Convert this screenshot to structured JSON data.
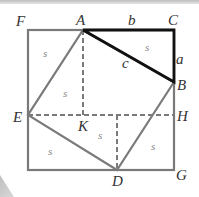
{
  "figure": {
    "points": {
      "F": "F",
      "A": "A",
      "C": "C",
      "B": "B",
      "H": "H",
      "G": "G",
      "D": "D",
      "E": "E",
      "K": "K"
    },
    "side_labels": {
      "a": "a",
      "b": "b",
      "c": "c"
    },
    "area_label": "s",
    "colors": {
      "outer_square": "#7a7a7a",
      "inner_square": "#7a7a7a",
      "triangle": "#111111",
      "dashed": "#7a7a7a",
      "text": "#333333",
      "area_text": "#888888"
    }
  }
}
